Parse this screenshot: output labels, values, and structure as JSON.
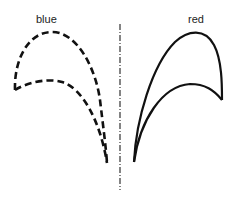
{
  "labels": {
    "left": "blue",
    "right": "red"
  },
  "colors": {
    "stroke": "#111111",
    "background": "#ffffff"
  },
  "shapes": [
    {
      "name": "blue",
      "line_style": "dashed"
    },
    {
      "name": "red",
      "line_style": "solid"
    }
  ],
  "axis": {
    "line_style": "dash-dot",
    "orientation": "vertical"
  }
}
